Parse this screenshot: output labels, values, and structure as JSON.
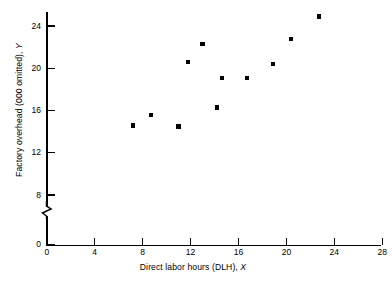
{
  "chart_data": {
    "type": "scatter",
    "title": "",
    "xlabel": "Direct labor hours (DLH), X",
    "ylabel": "Factory overhead (000 omitted), Y",
    "xlabel_parts": {
      "text": "Direct labor hours (DLH),",
      "symbol": "X"
    },
    "ylabel_parts": {
      "text": "Factory overhead (000 omitted),",
      "symbol": "Y"
    },
    "xlim": [
      0,
      30
    ],
    "ylim": [
      0,
      26
    ],
    "x_ticks": [
      0,
      4,
      8,
      12,
      16,
      20,
      24,
      28
    ],
    "x_tick_labels": [
      "0",
      "4",
      "8",
      "12",
      "16",
      "20",
      "24",
      "28"
    ],
    "y_ticks": [
      0,
      8,
      12,
      16,
      20,
      24
    ],
    "y_tick_labels": [
      "0",
      "8",
      "12",
      "16",
      "20",
      "24"
    ],
    "y_axis_break": true,
    "y_axis_break_between": [
      0,
      8
    ],
    "grid": false,
    "legend": null,
    "marker": "filled-square",
    "marker_color": "#000000",
    "points": [
      {
        "x": 7.2,
        "y": 14.6
      },
      {
        "x": 8.7,
        "y": 15.6
      },
      {
        "x": 11.0,
        "y": 14.5
      },
      {
        "x": 11.8,
        "y": 20.6
      },
      {
        "x": 13.0,
        "y": 22.3
      },
      {
        "x": 14.2,
        "y": 16.3
      },
      {
        "x": 14.6,
        "y": 19.1
      },
      {
        "x": 16.7,
        "y": 19.1
      },
      {
        "x": 18.9,
        "y": 20.4
      },
      {
        "x": 20.4,
        "y": 22.8
      },
      {
        "x": 22.7,
        "y": 24.9
      }
    ]
  }
}
